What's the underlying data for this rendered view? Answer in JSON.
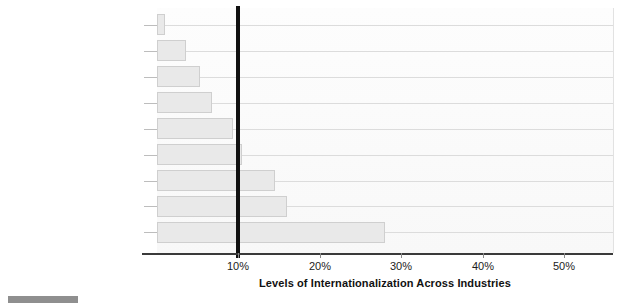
{
  "chart_data": {
    "type": "bar",
    "orientation": "horizontal",
    "title": "",
    "xlabel": "Levels of Internationalization Across Industries",
    "ylabel": "",
    "categories": [
      "Immigration (to Population)",
      "Phone Call Revenues",
      "Management Research",
      "Direct Investment",
      "Private Charity",
      "Management Cases",
      "Patents",
      "Portfolio Investment",
      "Trade"
    ],
    "values": [
      1,
      3.5,
      5.3,
      6.7,
      9.3,
      10.4,
      14.5,
      16,
      28
    ],
    "value_unit": "%",
    "xlim": [
      0,
      56
    ],
    "xticks": [
      10,
      20,
      30,
      40,
      50
    ],
    "xtick_labels": [
      "10%",
      "20%",
      "30%",
      "40%",
      "50%"
    ],
    "grid": true,
    "grid_axis": "y",
    "legend": "none",
    "annotations": [
      {
        "type": "reference-line",
        "axis": "x",
        "value": 10,
        "style": "thick-black",
        "label": ""
      }
    ],
    "colors": {
      "bar_fill": "#e9e9e9",
      "bar_border": "#cfcfcf",
      "reference_line": "#111111",
      "gridline": "#dcdcdc",
      "axis": "#3a3a3a",
      "text": "#1c1c1c",
      "plot_background": "#fcfcfc"
    }
  }
}
